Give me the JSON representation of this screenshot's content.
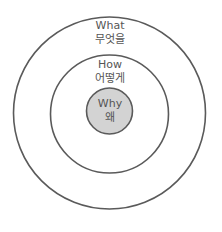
{
  "diagram": {
    "type": "golden-circle",
    "colors": {
      "stroke": "#5a5a5a",
      "inner_fill": "#d3d3d3",
      "text": "#555555"
    },
    "rings": [
      {
        "id": "outer",
        "en": "What",
        "ko": "무엇을"
      },
      {
        "id": "middle",
        "en": "How",
        "ko": "어떻게"
      },
      {
        "id": "inner",
        "en": "Why",
        "ko": "왜"
      }
    ]
  }
}
